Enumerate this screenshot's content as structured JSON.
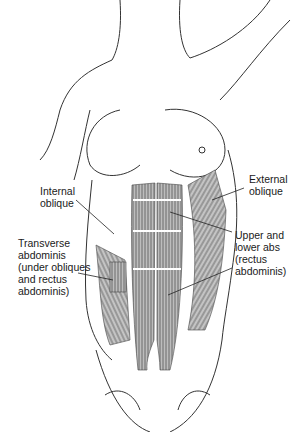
{
  "figure": {
    "labels": {
      "internal_oblique": "Internal\noblique",
      "external_oblique": "External\noblique",
      "transverse_abdominis": "Transverse\nabdominis\n(under obliques\nand rectus\nabdominis)",
      "rectus_abdominis": "Upper and\nlower abs\n(rectus\nabdominis)"
    }
  }
}
